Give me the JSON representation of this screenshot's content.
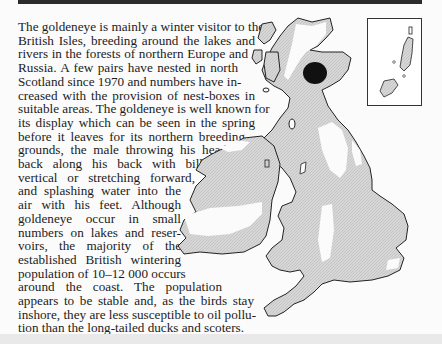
{
  "page": {
    "header_bar_color": "#2b2b2b",
    "body_lines": [
      {
        "text": "The goldeneye is mainly a winter visitor to the",
        "top": 20,
        "right": 255
      },
      {
        "text": "British Isles, breeding around the lakes and",
        "top": 35,
        "right": 255
      },
      {
        "text": "rivers in the forests of northern Europe and",
        "top": 50,
        "right": 248
      },
      {
        "text": "Russia. A few pairs have nested in north",
        "top": 66,
        "right": 238
      },
      {
        "text": "Scotland since 1970 and numbers have in-",
        "top": 81,
        "right": 238
      },
      {
        "text": "creased with the provision of nest-boxes in",
        "top": 97,
        "right": 255
      },
      {
        "text": "suitable areas. The goldeneye is well known for",
        "top": 112,
        "right": 255
      },
      {
        "text": "its display which can be seen in the spring",
        "top": 127,
        "right": 255
      },
      {
        "text": "before it leaves for its northern breeding",
        "top": 143,
        "right": 245
      },
      {
        "text": "grounds, the male throwing his head",
        "top": 158,
        "right": 227
      },
      {
        "text": "back along his back with bill",
        "top": 173,
        "right": 203
      },
      {
        "text": "vertical or stretching forward,",
        "top": 189,
        "right": 195
      },
      {
        "text": "and splashing water into the",
        "top": 204,
        "right": 181
      },
      {
        "text": "air with his feet. Although",
        "top": 219,
        "right": 181
      },
      {
        "text": "goldeneye occur in small",
        "top": 235,
        "right": 181
      },
      {
        "text": "numbers on lakes and reser-",
        "top": 250,
        "right": 181
      },
      {
        "text": "voirs, the majority of the",
        "top": 265,
        "right": 181
      },
      {
        "text": "established British wintering",
        "top": 281,
        "right": 181
      },
      {
        "text": "population of 10–12 000 occurs",
        "top": 296,
        "right": 183
      },
      {
        "text": "around the coast. The population",
        "top": 311,
        "right": 222
      },
      {
        "text": "appears to be stable and, as the birds stay",
        "top": 326,
        "right": 254
      },
      {
        "text": "inshore, they are less susceptible to oil pollu-",
        "top": 341,
        "right": 256
      },
      {
        "text": "tion than the long-tailed ducks and scoters.",
        "top": 356,
        "right": 230,
        "last": true
      }
    ]
  },
  "map": {
    "title": "goldeneye distribution map",
    "legend": {
      "winter_range_color": "#cfcfcf",
      "breeding_area_color": "#111111",
      "coast_line_color": "#222222"
    },
    "inset_label": "Shetland and Orkney inset"
  }
}
